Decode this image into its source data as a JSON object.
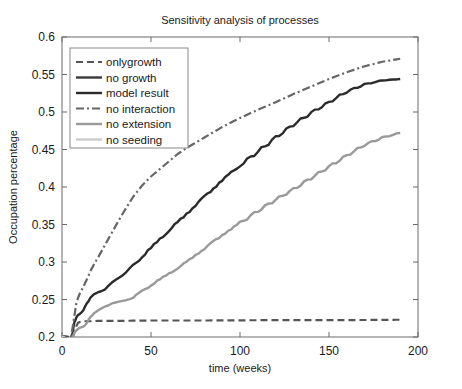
{
  "figure": {
    "title": "Sensitivity analysis of processes",
    "background": "#ffffff"
  },
  "chart_data": {
    "type": "line",
    "title": "Sensitivity analysis of processes",
    "xlabel": "time (weeks)",
    "ylabel": "Occupation percentage",
    "xlim": [
      0,
      200
    ],
    "ylim": [
      0.2,
      0.6
    ],
    "xticks": [
      0,
      50,
      100,
      150,
      200
    ],
    "xticklabels": [
      "0",
      "50",
      "100",
      "150",
      "200"
    ],
    "yticks": [
      0.2,
      0.25,
      0.3,
      0.35,
      0.4,
      0.45,
      0.5,
      0.55,
      0.6
    ],
    "yticklabels": [
      "0.2",
      "0.25",
      "0.3",
      "0.35",
      "0.4",
      "0.45",
      "0.5",
      "0.55",
      "0.6"
    ],
    "grid": false,
    "legend_position": "upper left",
    "note": "y-axis is clipped at 0.2; the two lowest flat curves run below the axis minimum near 0.175 and are drawn clipped at the bottom of the axes box",
    "series": [
      {
        "name": "onlygrowth",
        "color": "#555555",
        "style": "dashed",
        "width": 2.2,
        "x": [
          0,
          2,
          4,
          5,
          6,
          7,
          8,
          9,
          10,
          12,
          16,
          20,
          30,
          50,
          80,
          120,
          160,
          190
        ],
        "y": [
          0.201,
          0.201,
          0.2,
          0.199,
          0.2,
          0.206,
          0.214,
          0.219,
          0.22,
          0.221,
          0.221,
          0.2215,
          0.2215,
          0.222,
          0.222,
          0.2225,
          0.2225,
          0.223
        ]
      },
      {
        "name": "no growth",
        "color": "#3a3a3a",
        "style": "solid",
        "width": 2.4,
        "x": [
          0,
          2,
          4,
          5,
          6,
          7,
          8,
          10,
          14,
          20,
          30,
          45,
          60,
          80,
          100,
          130,
          160,
          190
        ],
        "y": [
          0.2,
          0.197,
          0.19,
          0.182,
          0.176,
          0.174,
          0.174,
          0.175,
          0.175,
          0.1755,
          0.176,
          0.176,
          0.1765,
          0.1765,
          0.177,
          0.177,
          0.1775,
          0.178
        ]
      },
      {
        "name": "model result",
        "color": "#2b2b2b",
        "style": "solid",
        "width": 2.4,
        "x": [
          0,
          3,
          5,
          6,
          7,
          8,
          9,
          10,
          12,
          14,
          16,
          18,
          20,
          24,
          28,
          32,
          36,
          40,
          45,
          50,
          55,
          60,
          65,
          70,
          75,
          80,
          85,
          90,
          95,
          100,
          110,
          120,
          130,
          140,
          150,
          160,
          170,
          180,
          190
        ],
        "y": [
          0.201,
          0.199,
          0.196,
          0.205,
          0.22,
          0.226,
          0.229,
          0.231,
          0.236,
          0.244,
          0.253,
          0.257,
          0.259,
          0.264,
          0.272,
          0.279,
          0.287,
          0.295,
          0.307,
          0.319,
          0.33,
          0.342,
          0.353,
          0.364,
          0.376,
          0.387,
          0.398,
          0.409,
          0.419,
          0.429,
          0.447,
          0.466,
          0.483,
          0.499,
          0.513,
          0.527,
          0.537,
          0.542,
          0.544
        ]
      },
      {
        "name": "no interaction",
        "color": "#666666",
        "style": "dashdot",
        "width": 2.2,
        "x": [
          0,
          3,
          5,
          6,
          7,
          8,
          9,
          10,
          12,
          14,
          16,
          18,
          20,
          24,
          28,
          32,
          36,
          40,
          45,
          50,
          55,
          60,
          65,
          70,
          75,
          80,
          90,
          100,
          110,
          120,
          130,
          140,
          150,
          160,
          170,
          180,
          190
        ],
        "y": [
          0.201,
          0.199,
          0.198,
          0.213,
          0.229,
          0.244,
          0.252,
          0.258,
          0.267,
          0.277,
          0.288,
          0.297,
          0.305,
          0.322,
          0.339,
          0.356,
          0.372,
          0.387,
          0.402,
          0.414,
          0.424,
          0.434,
          0.444,
          0.452,
          0.459,
          0.466,
          0.48,
          0.492,
          0.503,
          0.513,
          0.524,
          0.534,
          0.544,
          0.553,
          0.561,
          0.567,
          0.571
        ]
      },
      {
        "name": "no extension",
        "color": "#9a9a9a",
        "style": "solid",
        "width": 2.4,
        "x": [
          0,
          3,
          5,
          6,
          7,
          8,
          10,
          12,
          14,
          16,
          18,
          20,
          24,
          28,
          32,
          36,
          40,
          45,
          50,
          55,
          60,
          65,
          70,
          75,
          80,
          85,
          90,
          95,
          100,
          110,
          120,
          130,
          140,
          150,
          160,
          170,
          180,
          190
        ],
        "y": [
          0.2,
          0.198,
          0.195,
          0.199,
          0.206,
          0.209,
          0.212,
          0.214,
          0.219,
          0.226,
          0.232,
          0.235,
          0.24,
          0.245,
          0.247,
          0.249,
          0.253,
          0.261,
          0.269,
          0.277,
          0.284,
          0.292,
          0.3,
          0.309,
          0.318,
          0.327,
          0.336,
          0.344,
          0.352,
          0.368,
          0.383,
          0.397,
          0.412,
          0.427,
          0.442,
          0.456,
          0.466,
          0.472
        ]
      },
      {
        "name": "no seeding",
        "color": "#cccccc",
        "style": "solid",
        "width": 2.4,
        "x": [
          0,
          2,
          4,
          5,
          6,
          7,
          8,
          10,
          14,
          20,
          30,
          45,
          60,
          70,
          80,
          90,
          100,
          120,
          150,
          170,
          190
        ],
        "y": [
          0.201,
          0.198,
          0.192,
          0.183,
          0.177,
          0.174,
          0.173,
          0.174,
          0.174,
          0.1745,
          0.174,
          0.1735,
          0.172,
          0.1705,
          0.17,
          0.1715,
          0.173,
          0.174,
          0.174,
          0.1745,
          0.175
        ]
      }
    ]
  },
  "legend": {
    "entries": [
      {
        "label": "onlygrowth"
      },
      {
        "label": "no growth"
      },
      {
        "label": "model result"
      },
      {
        "label": "no interaction"
      },
      {
        "label": "no extension"
      },
      {
        "label": "no seeding"
      }
    ]
  }
}
